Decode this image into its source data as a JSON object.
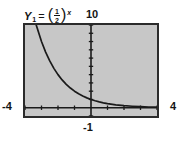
{
  "figure": {
    "kind": "graphing-calculator-screen",
    "background_color": "#ffffff",
    "plot_background_color": "#c7c7c7",
    "frame_color": "#2b2b2b",
    "curve_color": "#1a1a1a",
    "axis_color": "#1a1a1a"
  },
  "labels": {
    "function_var": "Y",
    "function_subscript": "1",
    "equals": "=",
    "paren_open": "(",
    "fraction_numerator": "1",
    "fraction_denominator": "2",
    "paren_close": ")",
    "exponent": "x",
    "function_plain": "Y1 = (1/2)^x",
    "y_max": "10",
    "x_min": "-4",
    "x_max": "4",
    "x_tick": "-1"
  },
  "chart_data": {
    "type": "line",
    "title": "",
    "subtitle": "",
    "xlabel": "",
    "ylabel": "",
    "equation": "Y1 = (1/2)^x",
    "xlim": [
      -4,
      4
    ],
    "ylim": [
      -1,
      10
    ],
    "xtick_labels": [
      "-4",
      "-1",
      "4"
    ],
    "ytick_labels": [
      "10"
    ],
    "x_axis_position_y": 0,
    "y_axis_position_x": 0,
    "grid": false,
    "tick_marks": true,
    "x_tick_step": 1,
    "y_tick_step": 1,
    "legend": "none",
    "series": [
      {
        "name": "Y1 = (1/2)^x",
        "x": [
          -3.32,
          -3.0,
          -2.75,
          -2.5,
          -2.25,
          -2.0,
          -1.75,
          -1.5,
          -1.25,
          -1.0,
          -0.75,
          -0.5,
          -0.25,
          0.0,
          0.25,
          0.5,
          0.75,
          1.0,
          1.5,
          2.0,
          2.5,
          3.0,
          3.5,
          4.0
        ],
        "y": [
          10.0,
          8.0,
          6.727,
          5.657,
          4.757,
          4.0,
          3.364,
          2.828,
          2.378,
          2.0,
          1.682,
          1.414,
          1.189,
          1.0,
          0.841,
          0.707,
          0.595,
          0.5,
          0.354,
          0.25,
          0.177,
          0.125,
          0.088,
          0.0625
        ]
      }
    ]
  }
}
